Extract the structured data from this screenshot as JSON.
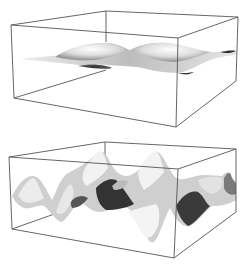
{
  "figure": {
    "description": "Two 3D surface plots inside wireframe bounding boxes",
    "panels": [
      {
        "id": "top",
        "label": "low-amplitude wavy surface",
        "amplitude": "small",
        "box": {
          "top": [
            [
              11,
              25
            ],
            [
              106,
              11
            ],
            [
              238,
              17
            ],
            [
              178,
              38
            ]
          ],
          "bottom": [
            [
              14,
              98
            ],
            [
              106,
              70
            ],
            [
              236,
              81
            ],
            [
              176,
              127
            ]
          ]
        },
        "surface_color_light": "#f2f2f2",
        "surface_color_dark": "#3a3a3a"
      },
      {
        "id": "bottom",
        "label": "high-amplitude wavy surface",
        "amplitude": "large",
        "box": {
          "top": [
            [
              9,
              157
            ],
            [
              105,
              142
            ],
            [
              236,
              149
            ],
            [
              178,
              169
            ]
          ],
          "bottom": [
            [
              12,
              229
            ],
            [
              105,
              206
            ],
            [
              236,
              212
            ],
            [
              174,
              258
            ]
          ]
        },
        "surface_color_light": "#f4f4f4",
        "surface_color_dark": "#2e2e2e"
      }
    ],
    "box_line_color": "#555555",
    "background": "#ffffff"
  }
}
